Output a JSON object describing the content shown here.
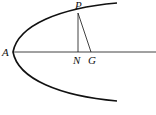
{
  "diagram": {
    "type": "parabola-normal",
    "labels": {
      "vertex": "A",
      "point": "P",
      "foot_of_ordinate": "N",
      "normal_intersection": "G"
    },
    "colors": {
      "stroke": "#111111",
      "background": "#ffffff"
    }
  }
}
